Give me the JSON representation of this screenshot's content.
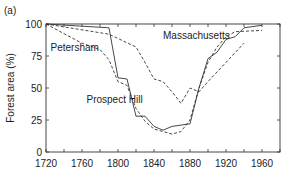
{
  "panel_label": "(a)",
  "chart_data": {
    "type": "line",
    "title": "",
    "xlabel": "",
    "ylabel": "Forest area (%)",
    "xlim": [
      1720,
      1980
    ],
    "ylim": [
      0,
      100
    ],
    "xticks": [
      1720,
      1760,
      1800,
      1840,
      1880,
      1920,
      1960
    ],
    "yticks": [
      0,
      25,
      50,
      75,
      100
    ],
    "grid": false,
    "legend": "inline labels",
    "series": [
      {
        "name": "Prospect Hill",
        "style": "solid",
        "x": [
          1720,
          1790,
          1800,
          1810,
          1820,
          1830,
          1840,
          1850,
          1860,
          1880,
          1890,
          1900,
          1910,
          1920,
          1930,
          1940,
          1960
        ],
        "values": [
          100,
          97,
          58,
          57,
          28,
          28,
          20,
          17,
          20,
          22,
          50,
          73,
          78,
          88,
          90,
          97,
          99
        ]
      },
      {
        "name": "Petersham",
        "style": "dashed",
        "x": [
          1720,
          1760,
          1780,
          1790,
          1800,
          1810,
          1820,
          1830,
          1840,
          1860,
          1870,
          1880,
          1890,
          1900,
          1910,
          1920,
          1930,
          1960
        ],
        "values": [
          100,
          85,
          80,
          72,
          55,
          52,
          34,
          24,
          18,
          14,
          16,
          25,
          50,
          70,
          82,
          90,
          94,
          95
        ]
      },
      {
        "name": "Massachusetts",
        "style": "dashed",
        "x": [
          1720,
          1790,
          1820,
          1830,
          1840,
          1850,
          1860,
          1870,
          1880,
          1890,
          1900,
          1920,
          1940
        ],
        "values": [
          100,
          92,
          82,
          70,
          57,
          55,
          47,
          38,
          50,
          47,
          55,
          70,
          85
        ]
      }
    ],
    "annotations": [
      {
        "text": "Massachusetts",
        "x": 1850,
        "y": 88
      },
      {
        "text": "Petersham",
        "x": 1725,
        "y": 79
      },
      {
        "text": "Prospect Hill",
        "x": 1765,
        "y": 38
      }
    ]
  }
}
